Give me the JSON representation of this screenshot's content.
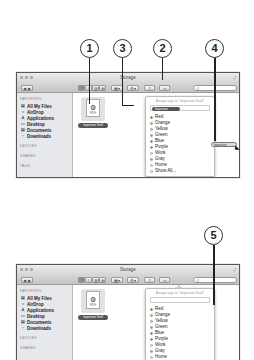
{
  "callouts": [
    {
      "n": "1"
    },
    {
      "n": "3"
    },
    {
      "n": "2"
    },
    {
      "n": "4"
    },
    {
      "n": "5"
    }
  ],
  "window": {
    "title": "Storage",
    "search_placeholder": "Q",
    "toolbar": {
      "back": "◀ ▶",
      "views": [
        "▦",
        "≡",
        "▥",
        "▤"
      ],
      "arrange": "▦▾",
      "action": "⚙▾",
      "share": "⇧",
      "tags": "▭"
    }
  },
  "sidebar": {
    "favorites_header": "FAVORITES",
    "items": [
      {
        "icon": "▤",
        "label": "All My Files"
      },
      {
        "icon": "≈",
        "label": "AirDrop"
      },
      {
        "icon": "A",
        "label": "Applications"
      },
      {
        "icon": "▭",
        "label": "Desktop"
      },
      {
        "icon": "▤",
        "label": "Documents"
      },
      {
        "icon": "○",
        "label": "Downloads"
      }
    ],
    "devices_header": "DEVICES",
    "shared_header": "SHARED",
    "tags_header": "TAGS"
  },
  "file": {
    "type": "PDF",
    "name": "Important Stuff",
    "partial_label": "uff"
  },
  "tag_popover": {
    "hint": "Assign tags to \"Important Stuff\"",
    "chip": "Important",
    "options": [
      {
        "label": "Red",
        "color": "#d84040"
      },
      {
        "label": "Orange",
        "color": "#f0903a"
      },
      {
        "label": "Yellow",
        "color": "#f2d23a"
      },
      {
        "label": "Green",
        "color": "#58b848"
      },
      {
        "label": "Blue",
        "color": "#3a7ee0"
      },
      {
        "label": "Purple",
        "color": "#9a5ac8"
      },
      {
        "label": "Work",
        "color": "#ffffff"
      },
      {
        "label": "Gray",
        "color": "#a0a0a0"
      },
      {
        "label": "Home",
        "color": "#ffffff"
      },
      {
        "label": "Show All...",
        "color": "#ffffff"
      }
    ]
  },
  "drag_chip": "Important"
}
